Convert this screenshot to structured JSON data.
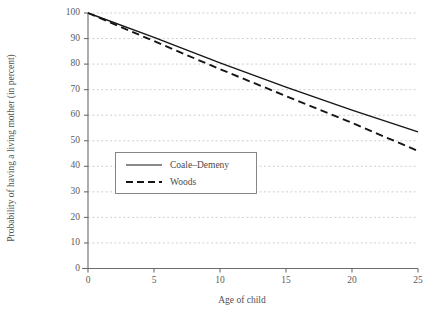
{
  "chart_data": {
    "type": "line",
    "title": "",
    "xlabel": "Age of child",
    "ylabel": "Probability of having a living mother (in percent)",
    "xlim": [
      0,
      25
    ],
    "ylim": [
      0,
      100
    ],
    "grid": true,
    "legend_position": "center-left",
    "x_ticks": [
      0,
      5,
      10,
      15,
      20,
      25
    ],
    "y_ticks": [
      0,
      10,
      20,
      30,
      40,
      50,
      60,
      70,
      80,
      90,
      100
    ],
    "x_tick_labels": [
      "0",
      "5",
      "10",
      "15",
      "20",
      "25"
    ],
    "y_tick_labels": [
      "0",
      "10",
      "20",
      "30",
      "40",
      "50",
      "60",
      "70",
      "80",
      "90",
      "100"
    ],
    "x": [
      0,
      5,
      10,
      15,
      20,
      25
    ],
    "series": [
      {
        "name": "Coale–Demeny",
        "style": "solid",
        "color": "#151515",
        "values": [
          100,
          90.5,
          80.5,
          71.0,
          62.0,
          53.5
        ]
      },
      {
        "name": "Woods",
        "style": "dashed",
        "color": "#151515",
        "values": [
          100,
          89.0,
          78.0,
          67.5,
          57.0,
          46.0
        ]
      }
    ]
  },
  "legend": {
    "entries": [
      {
        "label": "Coale–Demeny"
      },
      {
        "label": "Woods"
      }
    ]
  },
  "axes": {
    "x_title": "Age of child",
    "y_title": "Probability of having a living mother (in percent)"
  },
  "colors": {
    "line": "#151515",
    "axis": "#6b6b6b",
    "grid": "#b9b9c4",
    "text": "#4a4a4a",
    "background": "#ffffff"
  }
}
